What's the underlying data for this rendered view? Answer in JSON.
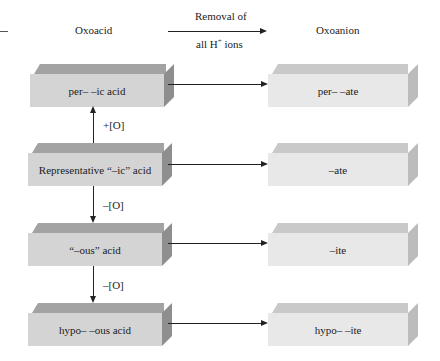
{
  "header": {
    "left_label": "Oxoacid",
    "arrow_top": "Removal of",
    "arrow_bottom_prefix": "all H",
    "arrow_bottom_sup": "+",
    "arrow_bottom_suffix": " ions",
    "right_label": "Oxoanion"
  },
  "acids": [
    {
      "label": "per– –ic acid"
    },
    {
      "label": "Representative “–ic” acid"
    },
    {
      "label": "“–ous” acid"
    },
    {
      "label": "hypo– –ous acid"
    }
  ],
  "anions": [
    {
      "label": "per– –ate"
    },
    {
      "label": "–ate"
    },
    {
      "label": "–ite"
    },
    {
      "label": "hypo– –ite"
    }
  ],
  "transitions": [
    {
      "label": "+[O]",
      "direction": "up"
    },
    {
      "label": "–[O]",
      "direction": "down"
    },
    {
      "label": "–[O]",
      "direction": "down"
    }
  ],
  "colors": {
    "acid_top": "#a3a3a3",
    "acid_front": "#d4d4d4",
    "acid_side": "#8e8e8e",
    "anion_top": "#c9c9c9",
    "anion_front": "#e8e8e8",
    "anion_side": "#bcbcbc"
  }
}
